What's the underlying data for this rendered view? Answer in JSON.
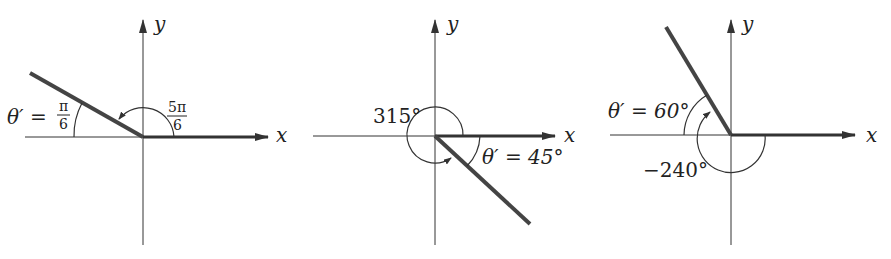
{
  "figures": [
    {
      "id": "fig1",
      "axis_x_label": "x",
      "axis_y_label": "y",
      "angle_label_num": "5π",
      "angle_label_den": "6",
      "ref_angle_prefix": "θ′ = ",
      "ref_angle_num": "π",
      "ref_angle_den": "6",
      "angle": "5π/6",
      "reference_angle": "π/6"
    },
    {
      "id": "fig2",
      "axis_x_label": "x",
      "axis_y_label": "y",
      "angle_label": "315°",
      "ref_angle_label": "θ′ = 45°",
      "angle": "315°",
      "reference_angle": "45°"
    },
    {
      "id": "fig3",
      "axis_x_label": "x",
      "axis_y_label": "y",
      "angle_label": "−240°",
      "ref_angle_label": "θ′ = 60°",
      "angle": "-240°",
      "reference_angle": "60°"
    }
  ],
  "colors": {
    "axis": "#333333",
    "terminal_side": "#444444",
    "text": "#222222"
  }
}
